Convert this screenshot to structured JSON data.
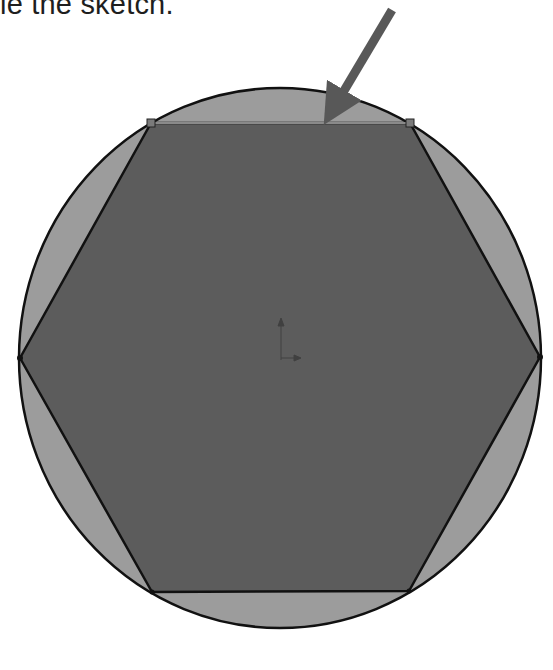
{
  "caption": {
    "text": "le the sketch."
  },
  "figure": {
    "colors": {
      "circle_fill": "#9c9c9c",
      "hexagon_fill": "#5c5c5c",
      "outline": "#111111",
      "arrow": "#585858",
      "vertex_marker": "#7a7a7a"
    },
    "circle": {
      "cx": 280,
      "cy": 358,
      "rx": 261,
      "ry": 270
    },
    "hexagon_vertices": [
      [
        151,
        123
      ],
      [
        410,
        123
      ],
      [
        540,
        357
      ],
      [
        409,
        591
      ],
      [
        152,
        592
      ],
      [
        20,
        358
      ]
    ],
    "arrow": {
      "from": [
        392,
        10
      ],
      "to": [
        328,
        118
      ]
    },
    "origin_marker": {
      "x": 281,
      "y": 340
    }
  }
}
